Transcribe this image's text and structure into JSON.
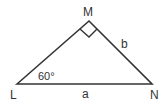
{
  "diagram": {
    "type": "right-triangle",
    "vertices": [
      {
        "name": "L",
        "x": 17,
        "y": 84
      },
      {
        "name": "M",
        "x": 89,
        "y": 21
      },
      {
        "name": "N",
        "x": 152,
        "y": 84
      }
    ],
    "labels": {
      "vertex_L": "L",
      "vertex_M": "M",
      "vertex_N": "N",
      "side_a": "a",
      "side_b": "b",
      "angle_L": "60°"
    },
    "right_angle_at": "M",
    "colors": {
      "stroke": "#333333",
      "text": "#333333",
      "background": "#ffffff"
    }
  }
}
